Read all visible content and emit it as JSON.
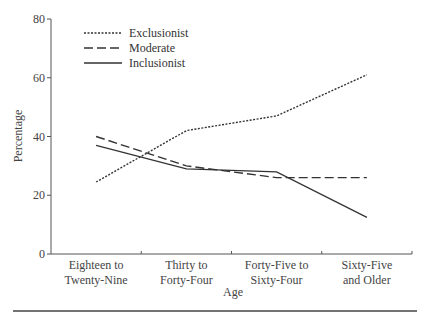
{
  "chart_data": {
    "type": "line",
    "title": "",
    "xlabel": "Age",
    "ylabel": "Percentage",
    "ylim": [
      0,
      80
    ],
    "yticks": [
      0,
      20,
      40,
      60,
      80
    ],
    "grid": false,
    "legend_position": "upper left",
    "categories": [
      [
        "Eighteen to",
        "Twenty-Nine"
      ],
      [
        "Thirty to",
        "Forty-Four"
      ],
      [
        "Forty-Five to",
        "Sixty-Four"
      ],
      [
        "Sixty-Five",
        "and Older"
      ]
    ],
    "series": [
      {
        "name": "Exclusionist",
        "style": "dotted",
        "values": [
          24.5,
          42,
          47,
          61
        ]
      },
      {
        "name": "Moderate",
        "style": "dashed",
        "values": [
          40,
          30,
          26,
          26
        ]
      },
      {
        "name": "Inclusionist",
        "style": "solid",
        "values": [
          37,
          29,
          28,
          12.5
        ]
      }
    ]
  },
  "colors": {
    "line": "#333333",
    "axis": "#555555",
    "text": "#444444"
  }
}
